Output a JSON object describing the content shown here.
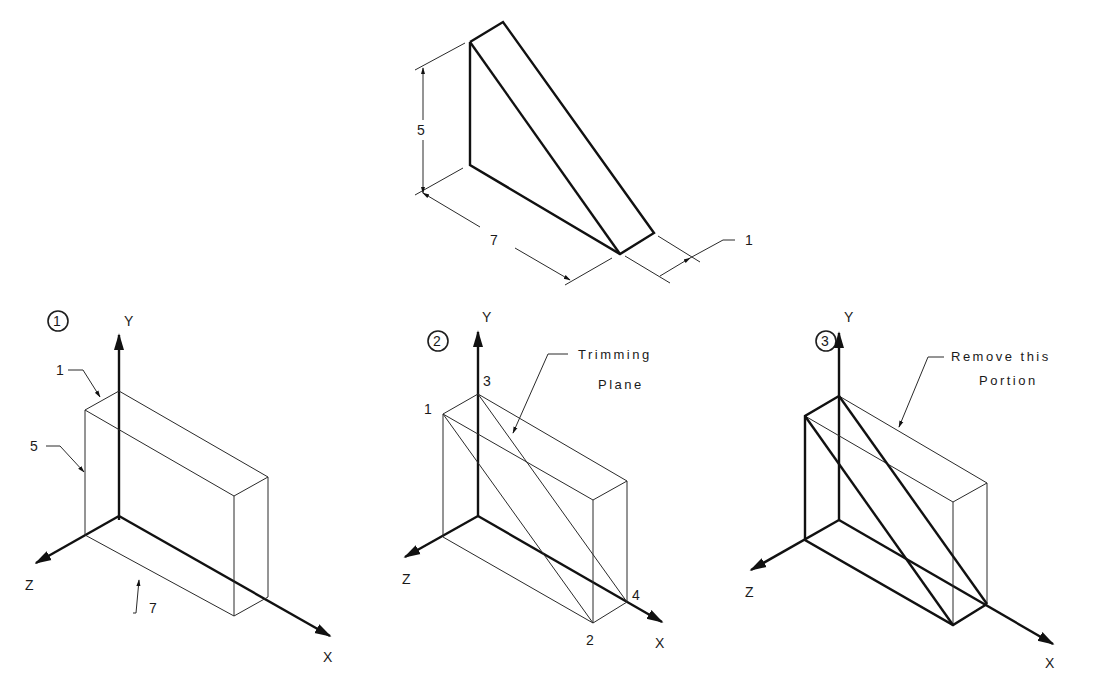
{
  "figure": {
    "top_view": {
      "dimensions": {
        "height": "5",
        "length": "7",
        "thickness": "1"
      }
    },
    "step1": {
      "badge": "1",
      "axes": {
        "x": "X",
        "y": "Y",
        "z": "Z"
      },
      "dimension_callouts": {
        "thickness": "1",
        "height": "5",
        "length": "7"
      }
    },
    "step2": {
      "badge": "2",
      "axes": {
        "x": "X",
        "y": "Y",
        "z": "Z"
      },
      "points": {
        "p1": "1",
        "p2": "2",
        "p3": "3",
        "p4": "4"
      },
      "callout_line1": "Trimming",
      "callout_line2": "Plane"
    },
    "step3": {
      "badge": "3",
      "axes": {
        "x": "X",
        "y": "Y",
        "z": "Z"
      },
      "callout_line1": "Remove this",
      "callout_line2": "Portion"
    }
  }
}
